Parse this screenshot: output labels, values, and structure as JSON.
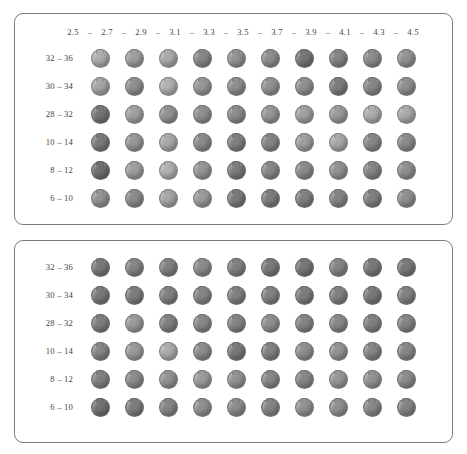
{
  "figure": {
    "background_color": "#ffffff",
    "border_color": "#7d7d7d",
    "text_color": "#3f3f3f"
  },
  "chart_data": {
    "type": "heatmap",
    "title": "",
    "subtitle": "",
    "xlabel": "",
    "ylabel": "",
    "grid": false,
    "legend": "none",
    "marker": "sphere",
    "value_encoding": "grayscale lightness (0 = dark, 100 = light)",
    "panels": [
      {
        "name": "panel-top",
        "show_column_header": true,
        "column_header_separator": "–",
        "categories": [
          "2.5",
          "2.7",
          "2.9",
          "3.1",
          "3.3",
          "3.5",
          "3.7",
          "3.9",
          "4.1",
          "4.3",
          "4.5"
        ],
        "columns": [
          "2.5",
          "2.7",
          "2.9",
          "3.1",
          "3.3",
          "3.5",
          "3.7",
          "3.9",
          "4.1",
          "4.3"
        ],
        "rows": [
          "32 – 36",
          "30 – 34",
          "28 – 32",
          "10 – 14",
          "8 – 12",
          "6 – 10"
        ],
        "series": [
          {
            "name": "32 – 36",
            "values": [
              72,
              64,
              70,
              52,
              58,
              55,
              42,
              50,
              54,
              58
            ]
          },
          {
            "name": "30 – 34",
            "values": [
              68,
              56,
              74,
              60,
              55,
              58,
              56,
              46,
              52,
              56
            ]
          },
          {
            "name": "28 – 32",
            "values": [
              42,
              66,
              58,
              56,
              54,
              60,
              66,
              62,
              72,
              70
            ]
          },
          {
            "name": "10 – 14",
            "values": [
              44,
              60,
              70,
              54,
              48,
              50,
              64,
              70,
              52,
              54
            ]
          },
          {
            "name": "8 – 12",
            "values": [
              38,
              64,
              74,
              60,
              46,
              52,
              54,
              58,
              50,
              56
            ]
          },
          {
            "name": "6 – 10",
            "values": [
              58,
              54,
              68,
              62,
              44,
              46,
              48,
              50,
              48,
              56
            ]
          }
        ]
      },
      {
        "name": "panel-bottom",
        "show_column_header": false,
        "column_header_separator": "–",
        "categories": [],
        "columns": [
          "c1",
          "c2",
          "c3",
          "c4",
          "c5",
          "c6",
          "c7",
          "c8",
          "c9",
          "c10"
        ],
        "rows": [
          "32 – 36",
          "30 – 34",
          "28 – 32",
          "10 – 14",
          "8 – 12",
          "6 – 10"
        ],
        "series": [
          {
            "name": "32 – 36",
            "values": [
              44,
              50,
              48,
              54,
              48,
              44,
              42,
              50,
              44,
              44
            ]
          },
          {
            "name": "30 – 34",
            "values": [
              44,
              46,
              48,
              50,
              48,
              48,
              46,
              48,
              44,
              48
            ]
          },
          {
            "name": "28 – 32",
            "values": [
              46,
              62,
              48,
              52,
              50,
              56,
              50,
              52,
              48,
              50
            ]
          },
          {
            "name": "10 – 14",
            "values": [
              50,
              62,
              72,
              54,
              44,
              48,
              56,
              58,
              50,
              52
            ]
          },
          {
            "name": "8 – 12",
            "values": [
              48,
              54,
              58,
              62,
              58,
              52,
              52,
              60,
              58,
              54
            ]
          },
          {
            "name": "6 – 10",
            "values": [
              40,
              46,
              50,
              56,
              54,
              50,
              58,
              56,
              52,
              50
            ]
          }
        ]
      }
    ]
  }
}
